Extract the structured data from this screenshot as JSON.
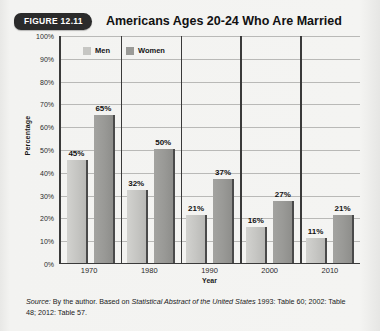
{
  "figure": {
    "badge_label": "FIGURE 12.11",
    "title": "Americans Ages 20-24 Who Are Married"
  },
  "source": {
    "prefix": "Source:",
    "text_before_italic": " By the author. Based on ",
    "italic_title": "Statistical Abstract of the United States",
    "text_after_italic": " 1993: Table 60; 2002: Table 48; 2012: Table 57."
  },
  "colors": {
    "men": "#c6c6c3",
    "women": "#9a9a97",
    "axis": "#3a3a3a",
    "grid": "#b9b9b7",
    "badge": "#2b2b2b",
    "page_background": "#f2f2f0"
  },
  "chart_data": {
    "type": "bar",
    "title": "Americans Ages 20-24 Who Are Married",
    "categories": [
      "1970",
      "1980",
      "1990",
      "2000",
      "2010"
    ],
    "series": [
      {
        "name": "Men",
        "values": [
          45,
          32,
          21,
          16,
          11
        ],
        "labels": [
          "45%",
          "32%",
          "21%",
          "16%",
          "11%"
        ],
        "color": "#c6c6c3"
      },
      {
        "name": "Women",
        "values": [
          65,
          50,
          37,
          27,
          21
        ],
        "labels": [
          "65%",
          "50%",
          "37%",
          "27%",
          "21%"
        ],
        "color": "#9a9a97"
      }
    ],
    "xlabel": "Year",
    "ylabel": "Percentage",
    "ylim": [
      0,
      100
    ],
    "ytick_step": 10,
    "ytick_labels": [
      "100%",
      "90%",
      "80%",
      "70%",
      "60%",
      "50%",
      "40%",
      "30%",
      "20%",
      "10%",
      "0%"
    ],
    "grid": true,
    "legend_position": "top-left",
    "value_labels": true
  }
}
